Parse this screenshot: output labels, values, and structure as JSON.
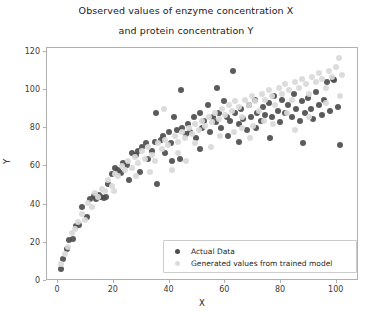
{
  "chart_data": {
    "type": "scatter",
    "title": "Observed values of enzyme concentration X\nand protein concentration Y",
    "title_line1": "Observed values of enzyme concentration X",
    "title_line2": "and protein concentration Y",
    "xlabel": "X",
    "ylabel": "Y",
    "xlim": [
      -4,
      108
    ],
    "ylim": [
      0,
      122
    ],
    "xticks": [
      0,
      20,
      40,
      60,
      80,
      100
    ],
    "yticks": [
      0,
      20,
      40,
      60,
      80,
      100,
      120
    ],
    "xticklabels": [
      "0",
      "20",
      "40",
      "60",
      "80",
      "100"
    ],
    "yticklabels": [
      "0",
      "20",
      "40",
      "60",
      "80",
      "100",
      "120"
    ],
    "grid": false,
    "legend_position": "lower right",
    "colors": {
      "actual": "#4d4d4d",
      "generated": "#d9d9d9",
      "axes": "#b0b0b0",
      "text": "#1a1a1a",
      "background": "#ffffff"
    },
    "series": [
      {
        "name": "Actual Data",
        "marker": "circle",
        "color": "#4d4d4d",
        "points": [
          [
            1.0,
            6.5
          ],
          [
            1.6,
            11.5
          ],
          [
            3.2,
            16.5
          ],
          [
            4.0,
            21.5
          ],
          [
            5.2,
            22.0
          ],
          [
            6.5,
            29.0
          ],
          [
            7.4,
            29.5
          ],
          [
            8.6,
            38.5
          ],
          [
            10.2,
            33.5
          ],
          [
            11.5,
            43.0
          ],
          [
            12.8,
            44.5
          ],
          [
            13.6,
            43.0
          ],
          [
            14.8,
            45.0
          ],
          [
            15.5,
            44.0
          ],
          [
            16.4,
            43.5
          ],
          [
            17.2,
            44.0
          ],
          [
            18.0,
            51.0
          ],
          [
            19.5,
            56.0
          ],
          [
            20.4,
            59.0
          ],
          [
            21.5,
            58.0
          ],
          [
            22.6,
            56.5
          ],
          [
            23.4,
            62.0
          ],
          [
            24.8,
            61.0
          ],
          [
            25.6,
            53.0
          ],
          [
            26.5,
            67.0
          ],
          [
            27.8,
            66.0
          ],
          [
            28.6,
            68.0
          ],
          [
            29.4,
            57.0
          ],
          [
            30.2,
            70.0
          ],
          [
            31.5,
            72.0
          ],
          [
            32.4,
            64.0
          ],
          [
            33.8,
            68.0
          ],
          [
            34.6,
            73.0
          ],
          [
            35.5,
            51.0
          ],
          [
            36.8,
            74.0
          ],
          [
            37.6,
            76.0
          ],
          [
            38.4,
            67.0
          ],
          [
            39.8,
            78.0
          ],
          [
            40.6,
            72.0
          ],
          [
            41.5,
            86.0
          ],
          [
            42.8,
            79.0
          ],
          [
            43.6,
            64.0
          ],
          [
            44.5,
            80.0
          ],
          [
            45.8,
            77.0
          ],
          [
            46.6,
            82.0
          ],
          [
            47.4,
            78.0
          ],
          [
            48.6,
            86.0
          ],
          [
            49.5,
            75.0
          ],
          [
            50.8,
            88.0
          ],
          [
            51.6,
            80.0
          ],
          [
            52.4,
            84.0
          ],
          [
            53.8,
            92.0
          ],
          [
            54.6,
            78.0
          ],
          [
            55.5,
            86.0
          ],
          [
            56.8,
            83.0
          ],
          [
            57.6,
            88.0
          ],
          [
            58.4,
            80.0
          ],
          [
            59.6,
            94.0
          ],
          [
            60.5,
            86.0
          ],
          [
            61.8,
            84.0
          ],
          [
            62.6,
            110.0
          ],
          [
            63.4,
            88.0
          ],
          [
            64.8,
            82.0
          ],
          [
            65.6,
            90.0
          ],
          [
            66.5,
            85.0
          ],
          [
            67.8,
            79.0
          ],
          [
            68.6,
            92.0
          ],
          [
            69.4,
            86.0
          ],
          [
            70.6,
            95.0
          ],
          [
            71.5,
            88.0
          ],
          [
            72.8,
            84.0
          ],
          [
            73.6,
            91.0
          ],
          [
            74.4,
            87.0
          ],
          [
            75.8,
            93.0
          ],
          [
            76.6,
            86.0
          ],
          [
            77.5,
            97.0
          ],
          [
            78.8,
            89.0
          ],
          [
            79.6,
            83.0
          ],
          [
            80.4,
            95.0
          ],
          [
            81.6,
            88.0
          ],
          [
            82.5,
            92.0
          ],
          [
            83.8,
            86.0
          ],
          [
            84.6,
            98.0
          ],
          [
            85.4,
            90.0
          ],
          [
            86.8,
            84.0
          ],
          [
            87.6,
            94.0
          ],
          [
            88.5,
            88.0
          ],
          [
            89.8,
            96.0
          ],
          [
            90.6,
            90.0
          ],
          [
            91.4,
            85.0
          ],
          [
            92.6,
            99.0
          ],
          [
            93.5,
            92.0
          ],
          [
            94.8,
            87.0
          ],
          [
            95.6,
            95.0
          ],
          [
            96.4,
            104.0
          ],
          [
            97.6,
            89.0
          ],
          [
            98.5,
            106.0
          ],
          [
            99.2,
            105.0
          ],
          [
            100.5,
            91.0
          ],
          [
            101.2,
            71.0
          ],
          [
            44.0,
            100.0
          ],
          [
            57.0,
            101.0
          ],
          [
            65.0,
            73.0
          ],
          [
            76.0,
            75.0
          ],
          [
            88.0,
            72.0
          ],
          [
            35.0,
            88.0
          ],
          [
            41.0,
            63.0
          ],
          [
            51.0,
            69.0
          ],
          [
            61.0,
            76.0
          ],
          [
            71.0,
            80.0
          ]
        ]
      },
      {
        "name": "Generated values from trained model",
        "marker": "circle",
        "color": "#d9d9d9",
        "points": [
          [
            1.2,
            9.0
          ],
          [
            2.4,
            14.0
          ],
          [
            3.6,
            18.0
          ],
          [
            4.8,
            25.0
          ],
          [
            6.0,
            27.0
          ],
          [
            7.2,
            31.0
          ],
          [
            8.4,
            35.0
          ],
          [
            9.6,
            32.0
          ],
          [
            10.8,
            41.0
          ],
          [
            12.0,
            39.0
          ],
          [
            13.2,
            46.0
          ],
          [
            14.4,
            44.0
          ],
          [
            15.6,
            48.0
          ],
          [
            16.8,
            47.0
          ],
          [
            18.0,
            53.0
          ],
          [
            19.2,
            50.0
          ],
          [
            20.4,
            56.0
          ],
          [
            21.6,
            55.0
          ],
          [
            22.8,
            60.0
          ],
          [
            24.0,
            58.0
          ],
          [
            25.2,
            63.0
          ],
          [
            26.4,
            59.0
          ],
          [
            27.6,
            65.0
          ],
          [
            28.8,
            62.0
          ],
          [
            30.0,
            68.0
          ],
          [
            31.2,
            64.0
          ],
          [
            32.4,
            70.0
          ],
          [
            33.6,
            66.0
          ],
          [
            34.8,
            63.0
          ],
          [
            36.0,
            72.0
          ],
          [
            37.2,
            69.0
          ],
          [
            38.4,
            74.0
          ],
          [
            39.6,
            71.0
          ],
          [
            40.8,
            58.0
          ],
          [
            42.0,
            76.0
          ],
          [
            43.2,
            73.0
          ],
          [
            44.4,
            78.0
          ],
          [
            45.6,
            75.0
          ],
          [
            46.8,
            80.0
          ],
          [
            48.0,
            77.0
          ],
          [
            49.2,
            82.0
          ],
          [
            50.4,
            79.0
          ],
          [
            51.6,
            84.0
          ],
          [
            52.8,
            81.0
          ],
          [
            54.0,
            86.0
          ],
          [
            55.2,
            83.0
          ],
          [
            56.4,
            88.0
          ],
          [
            57.6,
            85.0
          ],
          [
            58.8,
            90.0
          ],
          [
            60.0,
            87.0
          ],
          [
            61.2,
            92.0
          ],
          [
            62.4,
            89.0
          ],
          [
            63.6,
            94.0
          ],
          [
            64.8,
            91.0
          ],
          [
            66.0,
            86.0
          ],
          [
            67.2,
            95.0
          ],
          [
            68.4,
            92.0
          ],
          [
            69.6,
            97.0
          ],
          [
            70.8,
            94.0
          ],
          [
            72.0,
            89.0
          ],
          [
            73.2,
            98.0
          ],
          [
            74.4,
            95.0
          ],
          [
            75.6,
            100.0
          ],
          [
            76.8,
            97.0
          ],
          [
            78.0,
            92.0
          ],
          [
            79.2,
            101.0
          ],
          [
            80.4,
            98.0
          ],
          [
            81.6,
            103.0
          ],
          [
            82.8,
            100.0
          ],
          [
            84.0,
            95.0
          ],
          [
            85.2,
            104.0
          ],
          [
            86.4,
            101.0
          ],
          [
            87.6,
            106.0
          ],
          [
            88.8,
            103.0
          ],
          [
            90.0,
            98.0
          ],
          [
            91.2,
            107.0
          ],
          [
            92.4,
            104.0
          ],
          [
            93.6,
            109.0
          ],
          [
            94.8,
            106.0
          ],
          [
            96.0,
            101.0
          ],
          [
            97.2,
            110.0
          ],
          [
            98.4,
            107.0
          ],
          [
            99.6,
            112.0
          ],
          [
            100.8,
            117.0
          ],
          [
            102.0,
            108.0
          ],
          [
            38.0,
            90.0
          ],
          [
            46.0,
            63.0
          ],
          [
            55.0,
            70.0
          ],
          [
            63.0,
            78.0
          ],
          [
            70.0,
            81.0
          ],
          [
            20.0,
            47.0
          ],
          [
            28.0,
            55.0
          ],
          [
            33.0,
            57.0
          ],
          [
            43.0,
            67.0
          ],
          [
            49.0,
            72.0
          ],
          [
            58.0,
            76.0
          ],
          [
            66.0,
            80.0
          ],
          [
            74.0,
            84.0
          ],
          [
            82.0,
            88.0
          ],
          [
            90.0,
            86.0
          ],
          [
            96.0,
            93.0
          ],
          [
            101.0,
            97.0
          ],
          [
            85.0,
            79.0
          ],
          [
            77.0,
            82.0
          ],
          [
            69.0,
            75.0
          ]
        ]
      }
    ]
  },
  "legend": {
    "entries": [
      {
        "label": "Actual Data",
        "swatch": "actual"
      },
      {
        "label": "Generated values from trained model",
        "swatch": "gen"
      }
    ]
  }
}
